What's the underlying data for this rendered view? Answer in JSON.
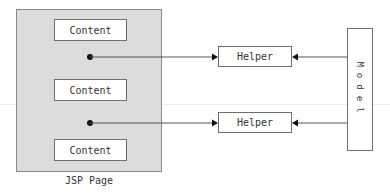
{
  "diagram": {
    "jsp_page": {
      "label": "JSP Page",
      "contents": [
        {
          "label": "Content"
        },
        {
          "label": "Content"
        },
        {
          "label": "Content"
        }
      ]
    },
    "helpers": [
      {
        "label": "Helper"
      },
      {
        "label": "Helper"
      }
    ],
    "model": {
      "label": "Model"
    },
    "connections": [
      {
        "from": "JSP Page (dot 1)",
        "to": "Helper 1"
      },
      {
        "from": "Model",
        "to": "Helper 1"
      },
      {
        "from": "JSP Page (dot 2)",
        "to": "Helper 2"
      },
      {
        "from": "Model",
        "to": "Helper 2"
      }
    ],
    "colors": {
      "page_fill": "#dcdcdc",
      "box_fill": "#ffffff",
      "stroke": "#555555"
    }
  }
}
